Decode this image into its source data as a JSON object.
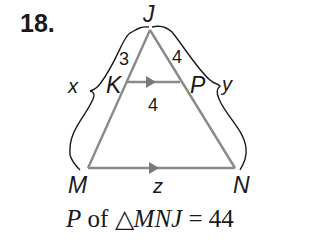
{
  "problem": {
    "number": "18.",
    "caption_prefix": "P",
    "caption_middle": " of △",
    "caption_triangle": "MNJ",
    "caption_suffix": " = 44"
  },
  "diagram": {
    "vertices": {
      "J": "J",
      "K": "K",
      "P": "P",
      "M": "M",
      "N": "N"
    },
    "segment_labels": {
      "JK": "3",
      "JP": "4",
      "KP": "4",
      "MN": "z"
    },
    "brace_labels": {
      "left": "x",
      "right": "y"
    },
    "colors": {
      "triangle": "#8a8a8a",
      "brace": "#1a1a1a",
      "text": "#1a1a1a"
    }
  }
}
